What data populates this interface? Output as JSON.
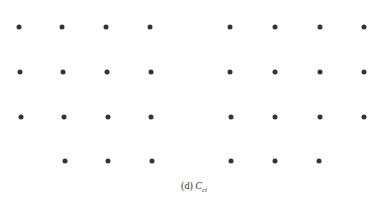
{
  "caption": {
    "label": "(d)",
    "symbol": "C",
    "subscript": "ci"
  },
  "dot_color": "#333333",
  "grid": {
    "rows": [
      {
        "y": 27,
        "xs": [
          19,
          62,
          106,
          150,
          230,
          275,
          320,
          364
        ]
      },
      {
        "y": 72,
        "xs": [
          20,
          63,
          107,
          151,
          230,
          275,
          320,
          364
        ]
      },
      {
        "y": 117,
        "xs": [
          21,
          64,
          108,
          151,
          231,
          275,
          320,
          364
        ]
      },
      {
        "y": 161,
        "xs": [
          65,
          108,
          152,
          231,
          275,
          319
        ]
      }
    ]
  }
}
